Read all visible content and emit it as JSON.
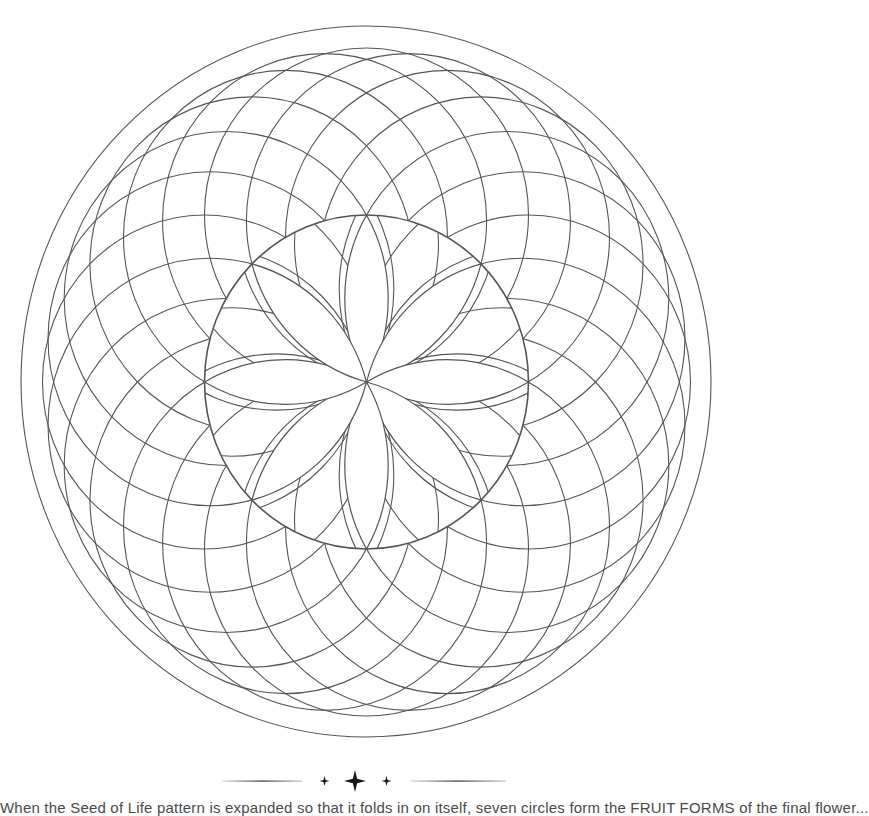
{
  "page": {
    "type": "coloring-page"
  },
  "mandala": {
    "stroke_color": "#555555",
    "outer_ring": {
      "cx": 366,
      "cy": 381.5,
      "rx": 345,
      "ry": 355.5
    },
    "center_disk": {
      "cx": 366.5,
      "cy": 382,
      "rx": 162,
      "ry": 167
    },
    "outer_circle_count": 24,
    "inner_circle_count": 16,
    "petal_count": 8
  },
  "divider": {
    "color": "#1a1a1a",
    "icons": [
      "small-star-icon",
      "large-star-icon",
      "small-star-icon"
    ]
  },
  "caption": {
    "text": "When the Seed of Life pattern is expanded so that it folds in on itself, seven circles form the FRUIT FORMS of the final flower..."
  }
}
